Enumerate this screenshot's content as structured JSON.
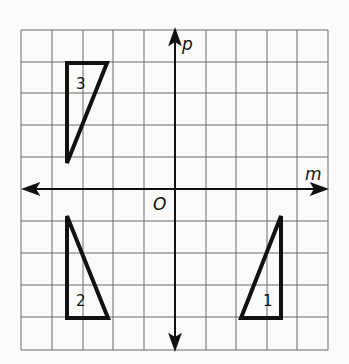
{
  "figure": {
    "axes": {
      "horizontal_label": "m",
      "vertical_label": "p",
      "origin_label": "O"
    },
    "grid": {
      "columns": 10,
      "rows": 10
    },
    "triangles": [
      {
        "label": "1",
        "vertices": [
          [
            3.4,
            -0.8
          ],
          [
            2.15,
            -4
          ],
          [
            3.4,
            -4
          ]
        ]
      },
      {
        "label": "2",
        "vertices": [
          [
            -3.4,
            -0.8
          ],
          [
            -3.4,
            -4
          ],
          [
            -2.1,
            -4
          ]
        ]
      },
      {
        "label": "3",
        "vertices": [
          [
            -3.4,
            4
          ],
          [
            -2.1,
            4
          ],
          [
            -3.4,
            0.8
          ]
        ]
      }
    ],
    "colors": {
      "grid": "#666666",
      "axes": "#111111",
      "shapes": "#111111",
      "background": "#fbfbfa"
    }
  }
}
